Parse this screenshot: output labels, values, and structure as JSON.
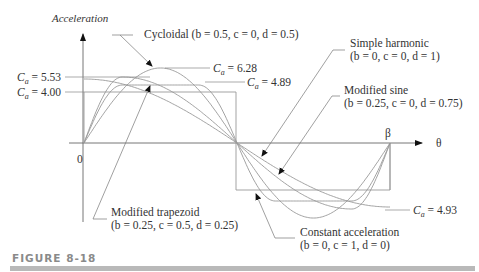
{
  "figure": {
    "caption": "FIGURE 8-18",
    "y_axis_label": "Acceleration",
    "x_axis_label": "θ",
    "origin_label": "0",
    "end_label": "β"
  },
  "annotations": {
    "cycloidal": "Cycloidal (b = 0.5, c = 0, d = 0.5)",
    "simple_harmonic_name": "Simple harmonic",
    "simple_harmonic_params": "(b = 0, c = 0, d = 1)",
    "modified_sine_name": "Modified sine",
    "modified_sine_params": "(b = 0.25, c = 0, d = 0.75)",
    "modified_trapezoid_name": "Modified trapezoid",
    "modified_trapezoid_params": "(b = 0.25, c = 0.5, d = 0.25)",
    "constant_accel_name": "Constant acceleration",
    "constant_accel_params": "(b = 0, c = 1, d = 0)",
    "ca_628": "= 6.28",
    "ca_553": "= 5.53",
    "ca_400": "= 4.00",
    "ca_489": "= 4.89",
    "ca_493": "= 4.93"
  },
  "chart_data": {
    "type": "line",
    "xlabel": "θ",
    "ylabel": "Acceleration",
    "x_range": [
      "0",
      "β"
    ],
    "series": [
      {
        "name": "Cycloidal",
        "b": 0.5,
        "c": 0,
        "d": 0.5,
        "peak_Ca": 6.28
      },
      {
        "name": "Modified trapezoid",
        "b": 0.25,
        "c": 0.5,
        "d": 0.25,
        "peak_Ca": 4.89
      },
      {
        "name": "Modified sine",
        "b": 0.25,
        "c": 0,
        "d": 0.75,
        "peak_Ca": 5.53
      },
      {
        "name": "Simple harmonic",
        "b": 0,
        "c": 0,
        "d": 1,
        "peak_Ca": 4.93
      },
      {
        "name": "Constant acceleration",
        "b": 0,
        "c": 1,
        "d": 0,
        "peak_Ca": 4.0
      }
    ],
    "colors": {
      "curve": "#8a8a8a",
      "axis": "#555555",
      "leader": "#777777"
    }
  }
}
